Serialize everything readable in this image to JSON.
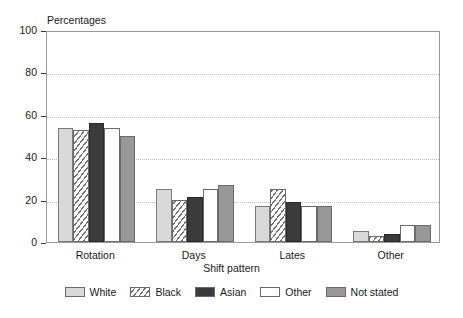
{
  "chart_data": {
    "type": "bar",
    "title": "",
    "subtitle": "",
    "ylabel": "Percentages",
    "xlabel": "Shift pattern",
    "ylim": [
      0,
      100
    ],
    "yticks": [
      0,
      20,
      40,
      60,
      80,
      100
    ],
    "ytick_labels": [
      "0",
      "20",
      "40",
      "60",
      "80",
      "100"
    ],
    "grid": "horizontal dotted gridlines at 20, 40, 60, 80",
    "legend_position": "bottom-center",
    "categories": [
      "Rotation",
      "Days",
      "Lates",
      "Other"
    ],
    "series": [
      {
        "name": "White",
        "values": [
          54,
          25,
          17,
          5
        ],
        "color": "#d9d9d9",
        "pattern": "solid-light-gray"
      },
      {
        "name": "Black",
        "values": [
          53,
          20,
          25,
          3
        ],
        "color": "#ffffff",
        "pattern": "diagonal-hatch"
      },
      {
        "name": "Asian",
        "values": [
          56,
          21,
          19,
          4
        ],
        "color": "#3b3b3b",
        "pattern": "solid-dark"
      },
      {
        "name": "Other",
        "values": [
          54,
          25,
          17,
          8
        ],
        "color": "#ffffff",
        "pattern": "solid-white"
      },
      {
        "name": "Not stated",
        "values": [
          50,
          27,
          17,
          8
        ],
        "color": "#989898",
        "pattern": "solid-medium-gray"
      }
    ]
  },
  "legend": {
    "items": [
      {
        "label": "White"
      },
      {
        "label": "Black"
      },
      {
        "label": "Asian"
      },
      {
        "label": "Other"
      },
      {
        "label": "Not stated"
      }
    ]
  }
}
